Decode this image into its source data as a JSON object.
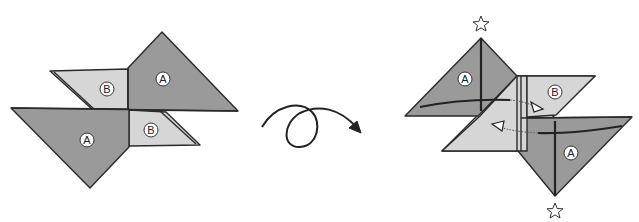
{
  "diagram": {
    "type": "origami-fold-step",
    "left_figure": {
      "panels": [
        {
          "label": "A",
          "shade": "dark",
          "position": "top-right"
        },
        {
          "label": "B",
          "shade": "light",
          "position": "top-left"
        },
        {
          "label": "A",
          "shade": "dark",
          "position": "bottom-left"
        },
        {
          "label": "B",
          "shade": "light",
          "position": "bottom-right"
        }
      ]
    },
    "transition": {
      "symbol": "turn-over-loop-arrow"
    },
    "right_figure": {
      "panels": [
        {
          "label": "A",
          "shade": "dark",
          "position": "top-left"
        },
        {
          "label": "B",
          "shade": "light",
          "position": "center"
        },
        {
          "label": "A",
          "shade": "dark",
          "position": "bottom-right"
        }
      ],
      "markers": [
        "star",
        "star"
      ],
      "arrows": [
        "insert-right",
        "insert-left"
      ]
    },
    "colors": {
      "dark": "#9a9a9a",
      "light": "#d6d6d6",
      "line": "#2a2a2a"
    }
  },
  "labels": {
    "l_a_top": "A",
    "l_b_top": "B",
    "l_a_bottom": "A",
    "l_b_bottom": "B",
    "r_a_top": "A",
    "r_b": "B",
    "r_a_bottom": "A"
  }
}
